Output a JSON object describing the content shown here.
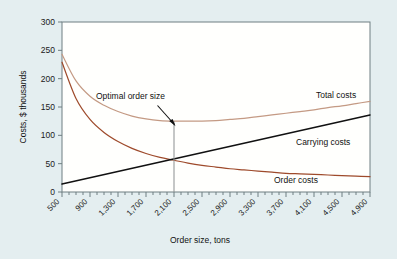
{
  "chart_data": {
    "type": "line",
    "title": "",
    "xlabel": "Order size, tons",
    "ylabel": "Costs, $ thousands",
    "xlim": [
      500,
      4900
    ],
    "ylim": [
      0,
      300
    ],
    "grid": false,
    "legend_position": "inline-right",
    "y_ticks": [
      0,
      50,
      100,
      150,
      200,
      250,
      300
    ],
    "y_tick_labels": [
      "0",
      "50",
      "100",
      "150",
      "200",
      "250",
      "300"
    ],
    "x_ticks": [
      500,
      900,
      1300,
      1700,
      2100,
      2500,
      2900,
      3300,
      3700,
      4100,
      4500,
      4900
    ],
    "x_tick_labels": [
      "500",
      "900",
      "1,300",
      "1,700",
      "2,100",
      "2,500",
      "2,900",
      "3,300",
      "3,700",
      "4,100",
      "4,500",
      "4,900"
    ],
    "x_minor_tick_step": 100,
    "series": [
      {
        "name": "Total costs",
        "color": "#c49a84",
        "x": [
          500,
          700,
          900,
          1100,
          1300,
          1500,
          1700,
          1900,
          2100,
          2300,
          2500,
          2700,
          2900,
          3100,
          3300,
          3500,
          3700,
          3900,
          4100,
          4300,
          4500,
          4700,
          4900
        ],
        "values": [
          243,
          196,
          169,
          153,
          142,
          134,
          129,
          126,
          125,
          125,
          125,
          126,
          128,
          130,
          133,
          136,
          139,
          142,
          145,
          149,
          152,
          156,
          160
        ]
      },
      {
        "name": "Order costs",
        "color": "#9e4a2b",
        "x": [
          500,
          700,
          900,
          1100,
          1300,
          1500,
          1700,
          1900,
          2100,
          2300,
          2500,
          2700,
          2900,
          3100,
          3300,
          3500,
          3700,
          3900,
          4100,
          4300,
          4500,
          4700,
          4900
        ],
        "values": [
          229,
          165,
          128,
          105,
          89,
          77,
          68,
          61,
          56,
          51,
          47,
          44,
          41,
          39,
          37,
          35,
          33,
          32,
          31,
          30,
          29,
          28,
          27
        ]
      },
      {
        "name": "Carrying costs",
        "color": "#111111",
        "x": [
          500,
          4900
        ],
        "values": [
          14,
          136
        ]
      }
    ],
    "annotations": [
      {
        "text": "Optimal order size",
        "x": 2100,
        "y": 125,
        "note": "arrow points to minimum of total costs curve; vertical reference line drops to x-axis"
      }
    ],
    "series_labels": [
      {
        "text": "Total costs",
        "for": "Total costs"
      },
      {
        "text": "Carrying costs",
        "for": "Carrying costs"
      },
      {
        "text": "Order costs",
        "for": "Order costs"
      }
    ]
  },
  "colors": {
    "background": "#e4eef0",
    "plot_background": "#fffffd",
    "axis": "#6f7f82",
    "total_costs": "#c49a84",
    "order_costs": "#9e4a2b",
    "carrying_costs": "#111111",
    "reference_line": "#8b8f90"
  }
}
